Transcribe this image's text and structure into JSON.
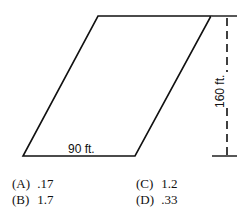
{
  "figure": {
    "shape": "parallelogram",
    "base_label": "90 ft.",
    "height_label": "160 ft.",
    "stroke_color": "#111111"
  },
  "choices": [
    {
      "letter": "(A)",
      "value": ".17"
    },
    {
      "letter": "(B)",
      "value": "1.7"
    },
    {
      "letter": "(C)",
      "value": "1.2"
    },
    {
      "letter": "(D)",
      "value": ".33"
    }
  ]
}
